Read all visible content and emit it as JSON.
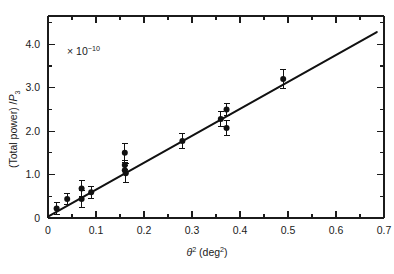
{
  "figure": {
    "annotation_multiplier": "× 10",
    "annotation_exponent": "−10",
    "y_axis_label_main": "(Total  power) /",
    "y_axis_label_symbol": "P",
    "y_axis_label_subscript": "3",
    "x_axis_label_symbol": "θ",
    "x_axis_label_exponent": "2",
    "x_axis_label_units": "(deg",
    "x_axis_label_units_exponent": "2",
    "x_axis_label_units_close": ")"
  },
  "chart_data": {
    "type": "scatter",
    "title": "",
    "xlabel": "θ² (deg²)",
    "ylabel": "(Total power) / P₃",
    "y_multiplier": "× 10⁻¹⁰",
    "xlim": [
      0,
      0.7
    ],
    "ylim": [
      0,
      4.65
    ],
    "grid": false,
    "legend": "none",
    "x_ticks_major": [
      0,
      0.1,
      0.2,
      0.3,
      0.4,
      0.5,
      0.6,
      0.7
    ],
    "x_tick_labels": [
      "0",
      "0.1",
      "0.2",
      "0.3",
      "0.4",
      "0.5",
      "0.6",
      "0.7"
    ],
    "x_ticks_minor": [
      0.05,
      0.15,
      0.25,
      0.35,
      0.45,
      0.55,
      0.65
    ],
    "y_ticks_major": [
      0,
      1.0,
      2.0,
      3.0,
      4.0
    ],
    "y_tick_labels": [
      "0",
      "1.0",
      "2.0",
      "3.0",
      "4.0"
    ],
    "y_ticks_minor": [
      0.5,
      1.5,
      2.5,
      3.5,
      4.5
    ],
    "points": [
      {
        "x": 0.018,
        "y": 0.22,
        "yerr": 0.14
      },
      {
        "x": 0.04,
        "y": 0.44,
        "yerr": 0.13
      },
      {
        "x": 0.07,
        "y": 0.68,
        "yerr": 0.18
      },
      {
        "x": 0.07,
        "y": 0.44,
        "yerr": 0.2
      },
      {
        "x": 0.09,
        "y": 0.59,
        "yerr": 0.14
      },
      {
        "x": 0.16,
        "y": 1.5,
        "yerr": 0.22
      },
      {
        "x": 0.16,
        "y": 1.22,
        "yerr": 0.1
      },
      {
        "x": 0.16,
        "y": 1.1,
        "yerr": 0.1
      },
      {
        "x": 0.162,
        "y": 1.03,
        "yerr": 0.22
      },
      {
        "x": 0.28,
        "y": 1.77,
        "yerr": 0.17
      },
      {
        "x": 0.36,
        "y": 2.28,
        "yerr": 0.17
      },
      {
        "x": 0.372,
        "y": 2.5,
        "yerr": 0.14
      },
      {
        "x": 0.372,
        "y": 2.07,
        "yerr": 0.17
      },
      {
        "x": 0.49,
        "y": 3.2,
        "yerr": 0.21
      }
    ],
    "fit_line": {
      "description": "linear least-squares fit through origin",
      "x_start": 0.0,
      "y_start": 0.03,
      "x_end": 0.685,
      "y_end": 4.28
    }
  }
}
